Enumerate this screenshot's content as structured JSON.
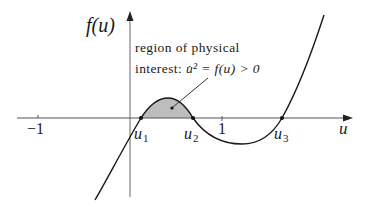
{
  "diagram": {
    "y_axis_label": "f(u)",
    "x_axis_label": "u",
    "annotation": {
      "line1": "region of physical",
      "line2_prefix": "interest: ",
      "line2_math": "u̇² = f(u) > 0"
    },
    "ticks": [
      {
        "label": "−1",
        "value": -1
      },
      {
        "label": "1",
        "value": 1
      }
    ],
    "roots": [
      {
        "symbol": "u",
        "subscript": "1"
      },
      {
        "symbol": "u",
        "subscript": "2"
      },
      {
        "symbol": "u",
        "subscript": "3"
      }
    ],
    "shaded_region": {
      "description": "area under f(u) between u1 and u2 where f(u) > 0",
      "fill_color": "#bdbdbd"
    },
    "colors": {
      "line": "#1a1a1a",
      "axis": "#555555",
      "shade": "#bdbdbd"
    }
  }
}
